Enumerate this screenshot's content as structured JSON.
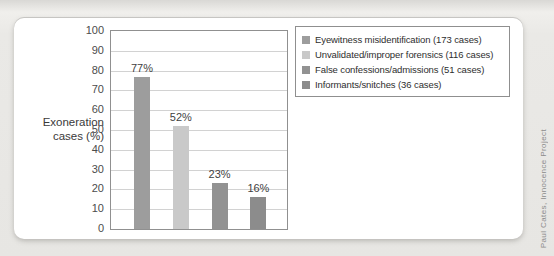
{
  "credit": "Paul Cates, Innocence Project",
  "colors": {
    "page_background": "#eae9e6",
    "card_background": "#ffffff",
    "axis_border": "#909090",
    "gridline": "#d2d2d2"
  },
  "chart_data": {
    "type": "bar",
    "title": "",
    "xlabel": "",
    "ylabel": "Exoneration cases (%)",
    "ylabel_lines": [
      "Exoneration",
      "cases (%)"
    ],
    "ylim": [
      0,
      100
    ],
    "yticks": [
      100,
      90,
      80,
      70,
      60,
      50,
      40,
      30,
      20,
      10,
      0
    ],
    "grid": true,
    "legend_position": "top-right",
    "categories": [
      "Eyewitness misidentification",
      "Unvalidated/improper forensics",
      "False confessions/admissions",
      "Informants/snitches"
    ],
    "bars": [
      {
        "category": "Eyewitness misidentification",
        "cases": 173,
        "value": 77,
        "value_label": "77%",
        "legend_label": "Eyewitness misidentification (173 cases)",
        "color": "#9d9d9d"
      },
      {
        "category": "Unvalidated/improper forensics",
        "cases": 116,
        "value": 52,
        "value_label": "52%",
        "legend_label": "Unvalidated/improper forensics (116 cases)",
        "color": "#c9c9c9"
      },
      {
        "category": "False confessions/admissions",
        "cases": 51,
        "value": 23,
        "value_label": "23%",
        "legend_label": "False confessions/admissions (51 cases)",
        "color": "#929292"
      },
      {
        "category": "Informants/snitches",
        "cases": 36,
        "value": 16,
        "value_label": "16%",
        "legend_label": "Informants/snitches (36 cases)",
        "color": "#8c8c8c"
      }
    ]
  }
}
